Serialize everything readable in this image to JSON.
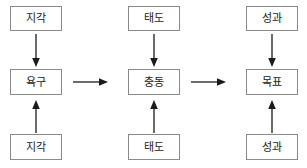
{
  "diagram": {
    "type": "flow-diagram",
    "columns": [
      {
        "id": "column-1",
        "top": {
          "label": "지각"
        },
        "middle": {
          "label": "욕구"
        },
        "bottom": {
          "label": "지각"
        }
      },
      {
        "id": "column-2",
        "top": {
          "label": "태도"
        },
        "middle": {
          "label": "충동"
        },
        "bottom": {
          "label": "태도"
        }
      },
      {
        "id": "column-3",
        "top": {
          "label": "성과"
        },
        "middle": {
          "label": "목표"
        },
        "bottom": {
          "label": "성과"
        }
      }
    ],
    "connectors": {
      "vertical_down": "아래쪽 화살표",
      "vertical_up": "위쪽 화살표",
      "horizontal_right": "오른쪽 화살표"
    },
    "colors": {
      "box_border": "#8a8a8a",
      "text": "#1b1b1b",
      "arrow": "#1b1b1b",
      "background": "#ffffff"
    }
  }
}
